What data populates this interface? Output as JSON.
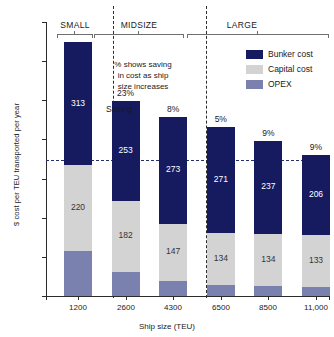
{
  "chart_data": {
    "type": "bar",
    "subtype": "stacked-bar",
    "title": "",
    "xlabel": "Ship size (TEU)",
    "ylabel": "$ cost per TEU transported per year",
    "categories": [
      "1200",
      "2600",
      "4300",
      "6500",
      "8500",
      "11,000"
    ],
    "ylim": [
      0,
      700
    ],
    "yticks": [
      0,
      100,
      200,
      300,
      400,
      500,
      600,
      700
    ],
    "grid": false,
    "legend_position": "top-right",
    "series": [
      {
        "name": "Bunker cost",
        "color": "#151b5e",
        "values": [
          313,
          253,
          273,
          271,
          237,
          206
        ]
      },
      {
        "name": "Capital cost",
        "color": "#d3d3d4",
        "values": [
          220,
          182,
          147,
          134,
          134,
          133
        ]
      },
      {
        "name": "OPEX",
        "color": "#7b81ae",
        "values": [
          115,
          62,
          38,
          28,
          25,
          22
        ]
      }
    ],
    "totals": [
      648,
      497,
      458,
      433,
      396,
      361
    ],
    "point_labels": {
      "percent_savings": [
        "",
        "23%",
        "8%",
        "5%",
        "9%",
        "9%"
      ]
    },
    "reference_line": {
      "value": 348,
      "style": "dashed",
      "color": "#23306b"
    },
    "groups": [
      {
        "label": "SMALL",
        "categories": [
          "1200"
        ]
      },
      {
        "label": "MIDSIZE",
        "categories": [
          "2600",
          "4300"
        ]
      },
      {
        "label": "LARGE",
        "categories": [
          "6500",
          "8500",
          "11,000"
        ]
      }
    ],
    "annotations": [
      {
        "name": "saving-note",
        "text": "% shows saving\nin cost as ship\nsize increases"
      },
      {
        "name": "saving-pointer",
        "text": "Saving"
      }
    ]
  },
  "axis": {
    "y_label": "$ cost per TEU transported per year",
    "x_label": "Ship size (TEU)",
    "y_ticks": [
      "700",
      "600",
      "500",
      "400",
      "300",
      "200",
      "100",
      "0"
    ],
    "x_ticks": [
      "1200",
      "2600",
      "4300",
      "6500",
      "8500",
      "11,000"
    ]
  },
  "groups": {
    "small": "SMALL",
    "midsize": "MIDSIZE",
    "large": "LARGE"
  },
  "annotation": {
    "note": "% shows saving\nin cost as ship\nsize increases",
    "saving_word": "Saving"
  },
  "bars": [
    {
      "category": "1200",
      "bunker": "313",
      "capital": "220",
      "opex": "",
      "pct": ""
    },
    {
      "category": "2600",
      "bunker": "253",
      "capital": "182",
      "opex": "",
      "pct": "23%"
    },
    {
      "category": "4300",
      "bunker": "273",
      "capital": "147",
      "opex": "",
      "pct": "8%"
    },
    {
      "category": "6500",
      "bunker": "271",
      "capital": "134",
      "opex": "",
      "pct": "5%"
    },
    {
      "category": "8500",
      "bunker": "237",
      "capital": "134",
      "opex": "",
      "pct": "9%"
    },
    {
      "category": "11,000",
      "bunker": "206",
      "capital": "133",
      "opex": "",
      "pct": "9%"
    }
  ],
  "legend": {
    "items": [
      {
        "label": "Bunker cost",
        "color": "#151b5e"
      },
      {
        "label": "Capital cost",
        "color": "#d3d3d4"
      },
      {
        "label": "OPEX",
        "color": "#7b81ae"
      }
    ]
  }
}
